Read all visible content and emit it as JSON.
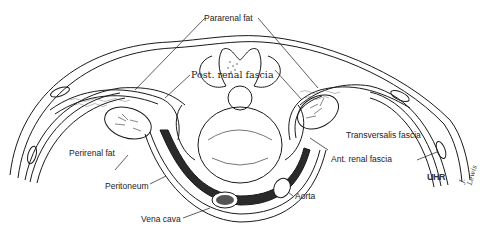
{
  "diagram": {
    "labels": {
      "pararenal_fat": "Pararenal fat",
      "post_renal_fascia": "Post. renal fascia",
      "perirenal_fat": "Perirenal fat",
      "peritoneum": "Peritoneum",
      "vena_cava": "Vena cava",
      "aorta": "Aorta",
      "transversalis_fascia": "Transversalis fascia",
      "ant_renal_fascia": "Ant. renal fascia"
    },
    "initials": "UHR",
    "signature": "J. Lewis",
    "colors": {
      "line": "#1a1a1a",
      "background": "#ffffff",
      "shade": "#2a2a2a"
    }
  }
}
